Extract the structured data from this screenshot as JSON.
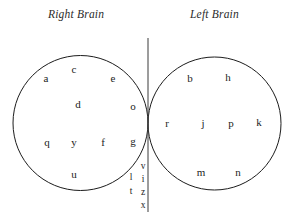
{
  "figure": {
    "title_left_region": "Right Brain",
    "title_right_region": "Left Brain",
    "background_color": "#ffffff",
    "stroke_color": "#1c1c1c",
    "text_color": "#1c1c1c"
  },
  "headings": {
    "right_brain": "Right Brain",
    "left_brain": "Left Brain"
  },
  "right_brain_letters": [
    {
      "char": "a",
      "x": 46,
      "y": 78
    },
    {
      "char": "c",
      "x": 74,
      "y": 69
    },
    {
      "char": "e",
      "x": 113,
      "y": 78
    },
    {
      "char": "d",
      "x": 78,
      "y": 104
    },
    {
      "char": "o",
      "x": 133,
      "y": 106
    },
    {
      "char": "q",
      "x": 47,
      "y": 142
    },
    {
      "char": "y",
      "x": 74,
      "y": 142
    },
    {
      "char": "f",
      "x": 103,
      "y": 142
    },
    {
      "char": "g",
      "x": 133,
      "y": 141
    },
    {
      "char": "u",
      "x": 74,
      "y": 174
    }
  ],
  "left_brain_letters": [
    {
      "char": "b",
      "x": 190,
      "y": 78
    },
    {
      "char": "h",
      "x": 228,
      "y": 77
    },
    {
      "char": "r",
      "x": 167,
      "y": 123
    },
    {
      "char": "j",
      "x": 203,
      "y": 123
    },
    {
      "char": "p",
      "x": 231,
      "y": 123
    },
    {
      "char": "k",
      "x": 259,
      "y": 122
    },
    {
      "char": "m",
      "x": 201,
      "y": 172
    },
    {
      "char": "n",
      "x": 238,
      "y": 172
    }
  ],
  "midline_left_column": [
    {
      "char": "l",
      "x": 131,
      "y": 178
    },
    {
      "char": "t",
      "x": 131,
      "y": 192
    }
  ],
  "midline_right_column": [
    {
      "char": "v",
      "x": 143,
      "y": 167
    },
    {
      "char": "i",
      "x": 143,
      "y": 180
    },
    {
      "char": "z",
      "x": 143,
      "y": 193
    },
    {
      "char": "x",
      "x": 143,
      "y": 206
    }
  ],
  "shapes": {
    "right_brain_circle": {
      "cx": 80.5,
      "cy": 123,
      "r": 67.5
    },
    "left_brain_circle": {
      "cx": 214.5,
      "cy": 123.5,
      "r": 66.5
    },
    "midline": {
      "x": 148,
      "y1": 38,
      "y2": 212
    }
  }
}
